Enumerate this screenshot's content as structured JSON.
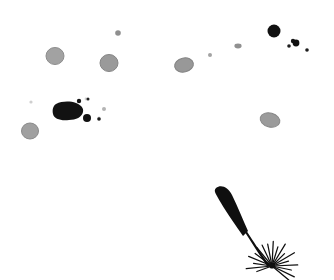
{
  "canvas": {
    "width": 334,
    "height": 280,
    "background_color": "#ffffff",
    "description": "Microscopy-style white field with scattered dark ink specks, grey rounded cells, and a single dark flagellate seed-like object at lower right"
  },
  "palette": {
    "background": "#ffffff",
    "ink_black": "#111111",
    "ink_dark": "#1a1a1a",
    "cell_grey_fill": "#9d9d9d",
    "cell_grey_rim": "#8a8a8a",
    "cell_grey_light": "#ababab",
    "faint_grey": "#c8c8c8"
  },
  "objects": {
    "grey_cells": [
      {
        "name": "grey-cell-upper-left",
        "cx": 55,
        "cy": 56,
        "rx": 9,
        "ry": 8.5,
        "rot": 0,
        "fill": "#a2a2a2",
        "rim": "#8d8d8d"
      },
      {
        "name": "grey-cell-upper-mid",
        "cx": 109,
        "cy": 63,
        "rx": 9,
        "ry": 8.5,
        "rot": 0,
        "fill": "#9a9a9a",
        "rim": "#868686"
      },
      {
        "name": "grey-cell-center-top",
        "cx": 184,
        "cy": 65,
        "rx": 9.5,
        "ry": 7,
        "rot": -12,
        "fill": "#989898",
        "rim": "#848484"
      },
      {
        "name": "grey-cell-lower-left",
        "cx": 30,
        "cy": 131,
        "rx": 8.5,
        "ry": 8,
        "rot": 0,
        "fill": "#a0a0a0",
        "rim": "#8b8b8b"
      },
      {
        "name": "grey-cell-right",
        "cx": 270,
        "cy": 120,
        "rx": 10,
        "ry": 7,
        "rot": 15,
        "fill": "#9b9b9b",
        "rim": "#878787"
      }
    ],
    "grey_specks": [
      {
        "name": "grey-speck-top",
        "cx": 118,
        "cy": 33,
        "r": 2.8,
        "fill": "#8f8f8f"
      },
      {
        "name": "grey-speck-mid-right",
        "cx": 210,
        "cy": 55,
        "r": 2.0,
        "fill": "#a3a3a3"
      },
      {
        "name": "grey-speck-upper-right",
        "cx": 238,
        "cy": 46,
        "r": 3.0,
        "fill": "#909090"
      },
      {
        "name": "faint-speck-left",
        "cx": 31,
        "cy": 102,
        "r": 1.6,
        "fill": "#cfcfcf"
      },
      {
        "name": "faint-speck-cluster-a",
        "cx": 86,
        "cy": 99,
        "r": 1.4,
        "fill": "#d2d2d2"
      },
      {
        "name": "faint-speck-cluster-b",
        "cx": 104,
        "cy": 109,
        "r": 2.0,
        "fill": "#b4b4b4"
      },
      {
        "name": "faint-speck-cluster-c",
        "cx": 99,
        "cy": 118,
        "r": 1.5,
        "fill": "#c4c4c4"
      }
    ],
    "black_dots": [
      {
        "name": "black-dot-large-top-right",
        "cx": 274,
        "cy": 31,
        "r": 6.5,
        "fill": "#111111"
      },
      {
        "name": "black-dot-cluster-a",
        "cx": 293,
        "cy": 41,
        "r": 2.2,
        "fill": "#161616"
      },
      {
        "name": "black-dot-cluster-b",
        "cx": 296,
        "cy": 43,
        "r": 3.4,
        "fill": "#111111"
      },
      {
        "name": "black-dot-cluster-c",
        "cx": 289,
        "cy": 46,
        "r": 1.8,
        "fill": "#1d1d1d"
      },
      {
        "name": "black-dot-cluster-d",
        "cx": 307,
        "cy": 50,
        "r": 1.8,
        "fill": "#1d1d1d"
      },
      {
        "name": "black-dot-splatter-a",
        "cx": 79,
        "cy": 101,
        "r": 2.2,
        "fill": "#141414"
      },
      {
        "name": "black-dot-splatter-b",
        "cx": 88,
        "cy": 99,
        "r": 1.5,
        "fill": "#222222"
      },
      {
        "name": "black-dot-splatter-c",
        "cx": 87,
        "cy": 118,
        "r": 4.0,
        "fill": "#111111"
      },
      {
        "name": "black-dot-splatter-d",
        "cx": 99,
        "cy": 119,
        "r": 1.8,
        "fill": "#1a1a1a"
      }
    ],
    "ink_blob": {
      "name": "ink-blob-main",
      "fill": "#121212",
      "path": "M 56 104 C 62 101 70 101 76 103 C 81 105 84 108 83 112 C 82 117 76 120 69 120 C 61 121 54 119 53 114 C 52 110 53 106 56 104 Z"
    },
    "flagellate": {
      "name": "flagellate-organism",
      "fill": "#0f0f0f",
      "head_path": "M 216 188 C 221 184 228 187 232 195 C 238 207 243 220 248 231 L 243 236 C 236 226 227 213 221 203 C 216 194 213 191 216 188 Z",
      "tail_path": "M 246 232 C 252 241 258 251 265 261 C 266 263 267 264 268 265",
      "burst_center_x": 272,
      "burst_center_y": 266,
      "ray_count": 18,
      "ray_length": 26
    }
  },
  "labels": {
    "title": "Specimen Field View"
  }
}
